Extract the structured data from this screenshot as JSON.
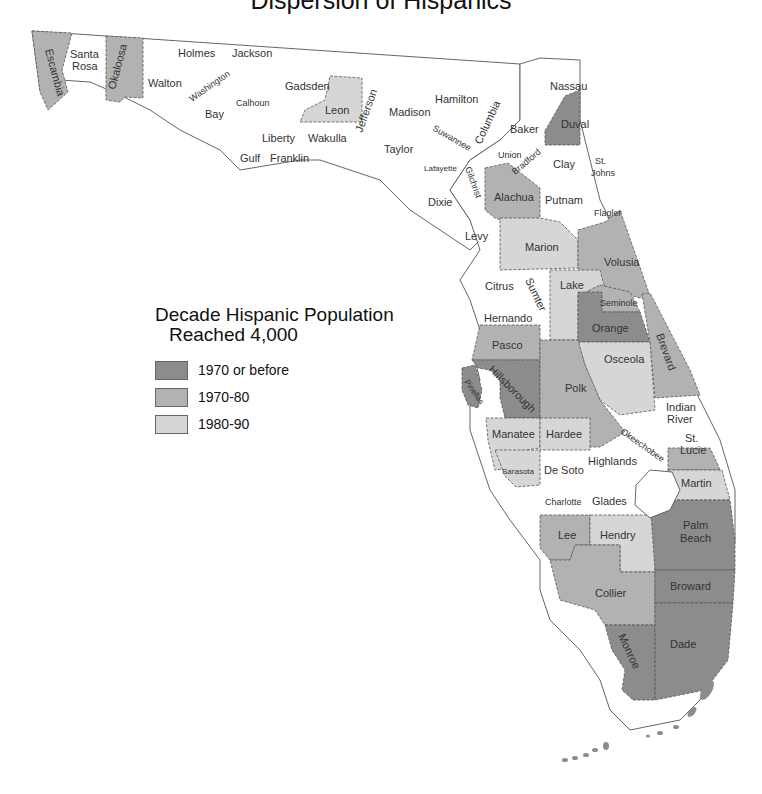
{
  "title": "Dispersion of Hispanics",
  "legend": {
    "title_line1": "Decade Hispanic Population",
    "title_line2": "Reached 4,000",
    "items": [
      {
        "label": "1970 or before",
        "color": "#8c8c8c"
      },
      {
        "label": "1970-80",
        "color": "#b2b2b2"
      },
      {
        "label": "1980-90",
        "color": "#d6d6d6"
      }
    ],
    "none_color": "#ffffff"
  },
  "counties": {
    "1970 or before": [
      "Duval",
      "Orange",
      "Hillsborough",
      "Pinellas",
      "Palm Beach",
      "Broward",
      "Dade",
      "Monroe"
    ],
    "1970-80": [
      "Escambia",
      "Okaloosa",
      "Alachua",
      "Volusia",
      "Seminole",
      "Brevard",
      "Polk",
      "Pasco",
      "Lee",
      "Collier",
      "St. Lucie"
    ],
    "1980-90": [
      "Leon",
      "Marion",
      "Lake",
      "Osceola",
      "Manatee",
      "Sarasota",
      "Hardee",
      "Hendry",
      "Martin"
    ],
    "not reached": [
      "Santa Rosa",
      "Walton",
      "Holmes",
      "Jackson",
      "Washington",
      "Bay",
      "Calhoun",
      "Gadsden",
      "Liberty",
      "Gulf",
      "Franklin",
      "Wakulla",
      "Jefferson",
      "Madison",
      "Taylor",
      "Hamilton",
      "Suwannee",
      "Lafayette",
      "Columbia",
      "Baker",
      "Union",
      "Bradford",
      "Nassau",
      "Clay",
      "St. Johns",
      "Putnam",
      "Flagler",
      "Gilchrist",
      "Dixie",
      "Levy",
      "Citrus",
      "Sumter",
      "Hernando",
      "Indian River",
      "Okeechobee",
      "Highlands",
      "De Soto",
      "Charlotte",
      "Glades"
    ]
  },
  "labels": {
    "escambia": "Escambia",
    "santa_rosa_1": "Santa",
    "santa_rosa_2": "Rosa",
    "okaloosa": "Okaloosa",
    "walton": "Walton",
    "holmes": "Holmes",
    "jackson": "Jackson",
    "washington": "Washington",
    "bay": "Bay",
    "calhoun": "Calhoun",
    "gadsden": "Gadsden",
    "liberty": "Liberty",
    "gulf": "Gulf",
    "franklin": "Franklin",
    "leon": "Leon",
    "wakulla": "Wakulla",
    "jefferson": "Jefferson",
    "madison": "Madison",
    "taylor": "Taylor",
    "hamilton": "Hamilton",
    "suwannee": "Suwannee",
    "lafayette": "Lafayette",
    "columbia": "Columbia",
    "baker": "Baker",
    "union": "Union",
    "bradford": "Bradford",
    "nassau": "Nassau",
    "duval": "Duval",
    "clay": "Clay",
    "st_johns_1": "St.",
    "st_johns_2": "Johns",
    "gilchrist": "Gilchrist",
    "dixie": "Dixie",
    "alachua": "Alachua",
    "putnam": "Putnam",
    "flagler": "Flagler",
    "levy": "Levy",
    "marion": "Marion",
    "volusia": "Volusia",
    "citrus": "Citrus",
    "sumter": "Sumter",
    "lake": "Lake",
    "seminole": "Seminole",
    "hernando": "Hernando",
    "orange": "Orange",
    "brevard": "Brevard",
    "pasco": "Pasco",
    "osceola": "Osceola",
    "hillsborough": "Hillsborough",
    "pinellas": "Pinellas",
    "polk": "Polk",
    "indian_river_1": "Indian",
    "indian_river_2": "River",
    "manatee": "Manatee",
    "hardee": "Hardee",
    "okeechobee": "Okeechobee",
    "st_lucie_1": "St.",
    "st_lucie_2": "Lucie",
    "sarasota": "Sarasota",
    "de_soto": "De Soto",
    "highlands": "Highlands",
    "martin": "Martin",
    "charlotte": "Charlotte",
    "glades": "Glades",
    "lee": "Lee",
    "hendry": "Hendry",
    "palm_beach_1": "Palm",
    "palm_beach_2": "Beach",
    "collier": "Collier",
    "broward": "Broward",
    "monroe": "Monroe",
    "dade": "Dade"
  }
}
